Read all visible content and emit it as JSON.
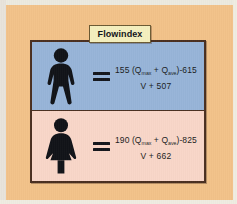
{
  "figure": {
    "title": "Flowindex",
    "background_color": "#f2c289",
    "panel_border_color": "#4a2f20",
    "title_box_color": "#f4efbe"
  },
  "rows": [
    {
      "sex": "male",
      "icon": "male-pictogram-icon",
      "background_color": "#97b4d8",
      "operator": "=",
      "formula": {
        "numerator_prefix": "155 (Q",
        "numerator_sub1": "max",
        "numerator_mid": " + Q",
        "numerator_sub2": "ave",
        "numerator_suffix": ")-615",
        "denominator": "V + 507",
        "numerator_plain": "155 (Qmax + Qave)-615"
      }
    },
    {
      "sex": "female",
      "icon": "female-pictogram-icon",
      "background_color": "#f8d6c8",
      "operator": "=",
      "formula": {
        "numerator_prefix": "190 (Q",
        "numerator_sub1": "max",
        "numerator_mid": " + Q",
        "numerator_sub2": "ave",
        "numerator_suffix": ")-825",
        "denominator": "V + 662",
        "numerator_plain": "190 (Qmax + Qave)-825"
      }
    }
  ]
}
